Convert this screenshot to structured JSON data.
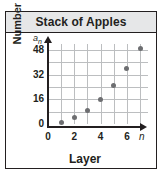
{
  "chart_data": {
    "type": "scatter",
    "title": "Stack of Apples",
    "xlabel": "Layer",
    "ylabel": "Number of apples",
    "x_variable": "n",
    "y_variable": "a",
    "y_variable_subscript": "n",
    "x": [
      1,
      2,
      3,
      4,
      5,
      6,
      7
    ],
    "values": [
      1,
      4,
      9,
      16,
      25,
      36,
      49
    ],
    "points": [
      {
        "x": 1,
        "y": 1
      },
      {
        "x": 2,
        "y": 4
      },
      {
        "x": 3,
        "y": 9
      },
      {
        "x": 4,
        "y": 16
      },
      {
        "x": 5,
        "y": 25
      },
      {
        "x": 6,
        "y": 36
      },
      {
        "x": 7,
        "y": 49
      }
    ],
    "xticks": [
      "0",
      "2",
      "4",
      "6"
    ],
    "xtick_values": [
      0,
      2,
      4,
      6
    ],
    "yticks": [
      "0",
      "16",
      "32",
      "48"
    ],
    "ytick_values": [
      0,
      16,
      32,
      48
    ],
    "xlim": [
      0,
      7.6
    ],
    "ylim": [
      0,
      52
    ],
    "grid": true,
    "grid_x_values": [
      1,
      2,
      3,
      4,
      5,
      6,
      7
    ],
    "grid_y_values": [
      8,
      16,
      24,
      32,
      40,
      48
    ],
    "legend": null,
    "marker_color": "#6d6e71",
    "grid_color": "#bcbec0",
    "axis_color": "#231f20",
    "title_band_color": "#e6e7e8"
  }
}
